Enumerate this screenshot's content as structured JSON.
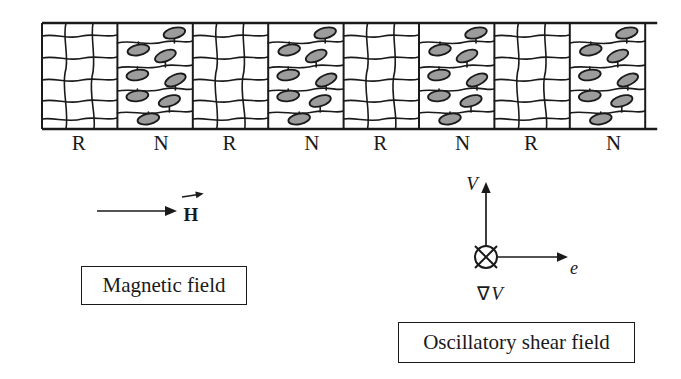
{
  "band": {
    "regions": [
      {
        "label": "R",
        "type": "network"
      },
      {
        "label": "N",
        "type": "nematic"
      },
      {
        "label": "R",
        "type": "network"
      },
      {
        "label": "N",
        "type": "nematic"
      },
      {
        "label": "R",
        "type": "network"
      },
      {
        "label": "N",
        "type": "nematic"
      },
      {
        "label": "R",
        "type": "network"
      },
      {
        "label": "N",
        "type": "nematic"
      }
    ]
  },
  "magnetic_field": {
    "vector_label": "H",
    "caption": "Magnetic field"
  },
  "shear_field": {
    "velocity_axis_label": "V",
    "direction_axis_label": "e",
    "gradient_symbol": "∇",
    "gradient_variable": "V",
    "caption": "Oscillatory shear field"
  },
  "colors": {
    "ink": "#1a1a1a",
    "droplet_fill": "#9c9c9c",
    "background": "#ffffff"
  }
}
